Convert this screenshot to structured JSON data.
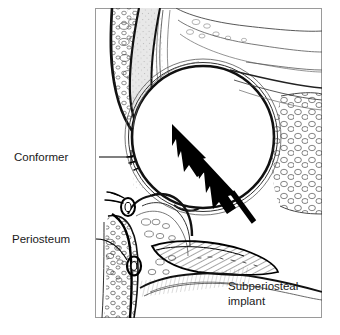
{
  "figure": {
    "kind": "anatomical-cross-section",
    "background_color": "#ffffff",
    "ink_color": "#000000",
    "frame": {
      "x": 95,
      "y": 8,
      "width": 227,
      "height": 310,
      "border_color": "#9a9a9a"
    }
  },
  "labels": {
    "conformer": "Conformer",
    "periosteum": "Periosteum",
    "implant_line1": "Subperiosteal",
    "implant_line2": "implant"
  },
  "annotations": {
    "arrows": [
      {
        "name": "upper-displacement-arrow",
        "direction": "up-left"
      },
      {
        "name": "lower-displacement-arrow",
        "direction": "up-left"
      }
    ],
    "arrow_color": "#000000"
  },
  "structures": [
    {
      "name": "upper-eyelid",
      "fill": "#ffffff"
    },
    {
      "name": "lower-eyelid",
      "fill": "#ffffff"
    },
    {
      "name": "eyelashes",
      "fill": "#000000"
    },
    {
      "name": "conformer-shell",
      "fill": "#e6e6e6"
    },
    {
      "name": "implant-sphere",
      "fill": "#ffffff"
    },
    {
      "name": "orbital-fat",
      "fill": "#ffffff"
    },
    {
      "name": "orbital-rim-bone",
      "fill": "#ffffff"
    },
    {
      "name": "subperiosteal-implant",
      "fill": "#ffffff"
    }
  ]
}
